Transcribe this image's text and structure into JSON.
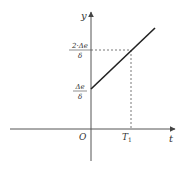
{
  "diagram": {
    "type": "line-graph",
    "axes": {
      "x_label": "t",
      "y_label": "y",
      "origin_label": "O"
    },
    "x_ticks": [
      {
        "label_main": "T",
        "label_sub": "1"
      }
    ],
    "y_ticks": [
      {
        "numerator": "Δe",
        "denominator": "δ"
      },
      {
        "numerator": "2·Δe",
        "denominator": "δ"
      }
    ],
    "line": {
      "description": "Straight line starting at y = Δe/δ on the y-axis, rising to 2·Δe/δ at t = T1 and continuing",
      "color": "#222222"
    },
    "guides": {
      "style": "dashed",
      "color": "#555555"
    }
  }
}
